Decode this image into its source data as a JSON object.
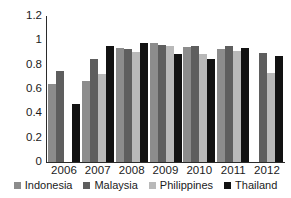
{
  "chart_data": {
    "type": "bar",
    "title": "",
    "xlabel": "",
    "ylabel": "",
    "ylim": [
      0,
      1.2
    ],
    "ytick_labels": [
      "1.2",
      "1",
      "0.8",
      "0.6",
      "0.4",
      "0.2",
      "0"
    ],
    "ytick_values": [
      1.2,
      1,
      0.8,
      0.6,
      0.4,
      0.2,
      0
    ],
    "grid": false,
    "legend_position": "bottom",
    "categories": [
      "2006",
      "2007",
      "2008",
      "2009",
      "2010",
      "2011",
      "2012"
    ],
    "series": [
      {
        "name": "Indonesia",
        "color": "#8c8c8c",
        "values": [
          0.64,
          0.665,
          0.935,
          0.975,
          0.945,
          0.925,
          null
        ]
      },
      {
        "name": "Malaysia",
        "color": "#5e5e5e",
        "values": [
          0.745,
          0.85,
          0.925,
          0.965,
          0.955,
          0.955,
          0.9
        ]
      },
      {
        "name": "Philippines",
        "color": "#b9b9b9",
        "values": [
          null,
          0.72,
          0.905,
          0.955,
          0.885,
          0.915,
          0.735
        ]
      },
      {
        "name": "Thailand",
        "color": "#121212",
        "values": [
          0.475,
          0.95,
          0.975,
          0.89,
          0.85,
          0.935,
          0.87
        ]
      }
    ]
  },
  "legend": {
    "items": [
      {
        "label": "Indonesia",
        "color": "#8c8c8c",
        "key": "indonesia"
      },
      {
        "label": "Malaysia",
        "color": "#5e5e5e",
        "key": "malaysia"
      },
      {
        "label": "Philippines",
        "color": "#b9b9b9",
        "key": "philippines"
      },
      {
        "label": "Thailand",
        "color": "#121212",
        "key": "thailand"
      }
    ]
  }
}
